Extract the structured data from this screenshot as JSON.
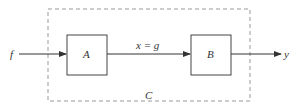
{
  "diagram": {
    "type": "block-diagram",
    "input_label": "f",
    "output_label": "y",
    "blocks": [
      {
        "id": "A",
        "label": "A"
      },
      {
        "id": "B",
        "label": "B"
      }
    ],
    "connection_label": "x = g",
    "container_label": "C",
    "colors": {
      "stroke": "#3a3a3a",
      "dashed": "#888888",
      "background": "#ffffff"
    }
  }
}
